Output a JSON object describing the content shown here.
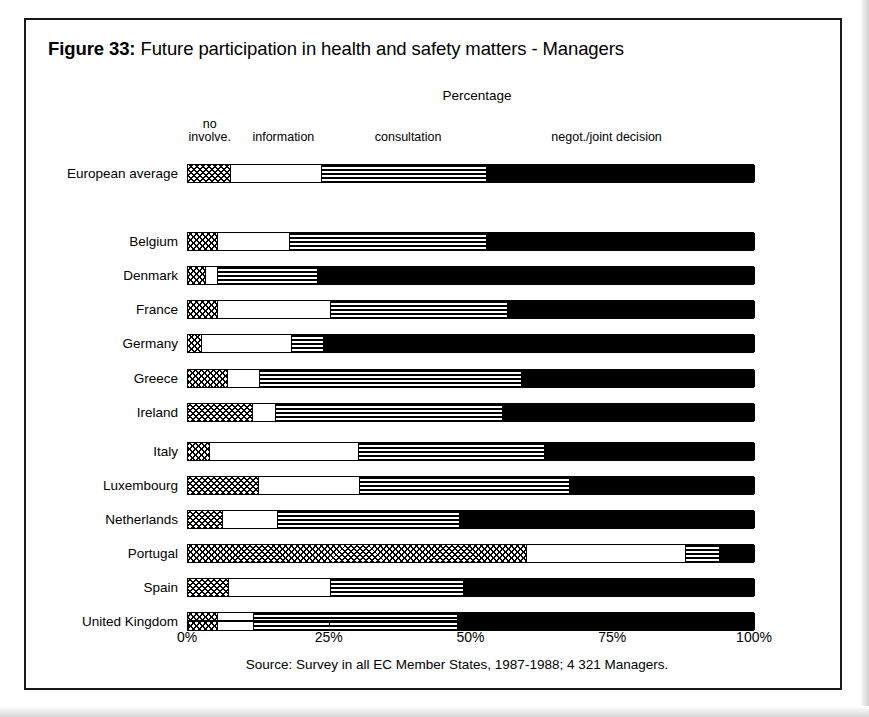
{
  "figure": {
    "number_label": "Figure 33:",
    "title": "Future participation in health and safety matters - Managers",
    "axis_title": "Percentage",
    "source": "Source: Survey in all EC Member States, 1987-1988; 4 321 Managers."
  },
  "legend": [
    {
      "label": "no\ninvolve.",
      "line1": "no",
      "line2": "involve.",
      "center_pct": 4.0
    },
    {
      "label": "information",
      "line1": "",
      "line2": "information",
      "center_pct": 17.0
    },
    {
      "label": "consultation",
      "line1": "",
      "line2": "consultation",
      "center_pct": 39.0
    },
    {
      "label": "negot./joint decision",
      "line1": "",
      "line2": "negot./joint decision",
      "center_pct": 74.0
    }
  ],
  "axis": {
    "min": 0,
    "max": 100,
    "ticks": [
      0,
      25,
      50,
      75,
      100
    ],
    "tick_labels": [
      "0%",
      "25%",
      "50%",
      "75%",
      "100%"
    ]
  },
  "chart_data": {
    "type": "bar",
    "orientation": "horizontal",
    "stacked": true,
    "normalized_to_percent": true,
    "title": "Future participation in health and safety matters - Managers",
    "subtitle": "Figure 33",
    "xlabel": "Percentage",
    "ylabel": "",
    "xlim": [
      0,
      100
    ],
    "xticks": [
      0,
      25,
      50,
      75,
      100
    ],
    "xticklabels": [
      "0%",
      "25%",
      "50%",
      "75%",
      "100%"
    ],
    "grid": false,
    "legend_position": "top",
    "source": "Source: Survey in all EC Member States, 1987-1988; 4 321 Managers.",
    "categories": [
      "European average",
      "Belgium",
      "Denmark",
      "France",
      "Germany",
      "Greece",
      "Ireland",
      "Italy",
      "Luxembourg",
      "Netherlands",
      "Portugal",
      "Spain",
      "United Kingdom"
    ],
    "series": [
      {
        "name": "no involve.",
        "pattern": "checkerboard",
        "values": [
          7.5,
          5.3,
          3.1,
          5.3,
          2.5,
          7.0,
          11.5,
          3.9,
          12.5,
          6.1,
          59.8,
          7.2,
          5.3
        ]
      },
      {
        "name": "information",
        "pattern": "white",
        "values": [
          16.1,
          12.7,
          2.2,
          19.9,
          15.8,
          5.7,
          4.0,
          26.3,
          17.9,
          9.7,
          28.0,
          18.1,
          6.4
        ]
      },
      {
        "name": "consultation",
        "pattern": "horizontal-stripes",
        "values": [
          29.1,
          34.7,
          17.7,
          31.2,
          5.7,
          46.2,
          40.0,
          32.8,
          36.9,
          32.1,
          6.0,
          23.3,
          36.0
        ]
      },
      {
        "name": "negot./joint decision",
        "pattern": "solid-black",
        "values": [
          47.3,
          47.3,
          77.0,
          43.6,
          76.0,
          41.1,
          44.5,
          37.0,
          32.7,
          52.1,
          6.2,
          51.4,
          52.3
        ]
      }
    ],
    "rows": [
      {
        "category": "European average",
        "no_involve": 7.5,
        "information": 16.1,
        "consultation": 29.1,
        "negotiation": 47.3,
        "group": "average"
      },
      {
        "category": "Belgium",
        "no_involve": 5.3,
        "information": 12.7,
        "consultation": 34.7,
        "negotiation": 47.3,
        "group": "country"
      },
      {
        "category": "Denmark",
        "no_involve": 3.1,
        "information": 2.2,
        "consultation": 17.7,
        "negotiation": 77.0,
        "group": "country"
      },
      {
        "category": "France",
        "no_involve": 5.3,
        "information": 19.9,
        "consultation": 31.2,
        "negotiation": 43.6,
        "group": "country"
      },
      {
        "category": "Germany",
        "no_involve": 2.5,
        "information": 15.8,
        "consultation": 5.7,
        "negotiation": 76.0,
        "group": "country"
      },
      {
        "category": "Greece",
        "no_involve": 7.0,
        "information": 5.7,
        "consultation": 46.2,
        "negotiation": 41.1,
        "group": "country"
      },
      {
        "category": "Ireland",
        "no_involve": 11.5,
        "information": 4.0,
        "consultation": 40.0,
        "negotiation": 44.5,
        "group": "country"
      },
      {
        "category": "Italy",
        "no_involve": 3.9,
        "information": 26.3,
        "consultation": 32.8,
        "negotiation": 37.0,
        "group": "country"
      },
      {
        "category": "Luxembourg",
        "no_involve": 12.5,
        "information": 17.9,
        "consultation": 36.9,
        "negotiation": 32.7,
        "group": "country"
      },
      {
        "category": "Netherlands",
        "no_involve": 6.1,
        "information": 9.7,
        "consultation": 32.1,
        "negotiation": 52.1,
        "group": "country"
      },
      {
        "category": "Portugal",
        "no_involve": 59.8,
        "information": 28.0,
        "consultation": 6.0,
        "negotiation": 6.2,
        "group": "country"
      },
      {
        "category": "Spain",
        "no_involve": 7.2,
        "information": 18.1,
        "consultation": 23.3,
        "negotiation": 51.4,
        "group": "country"
      },
      {
        "category": "United Kingdom",
        "no_involve": 5.3,
        "information": 6.4,
        "consultation": 36.0,
        "negotiation": 52.3,
        "group": "country"
      }
    ]
  }
}
